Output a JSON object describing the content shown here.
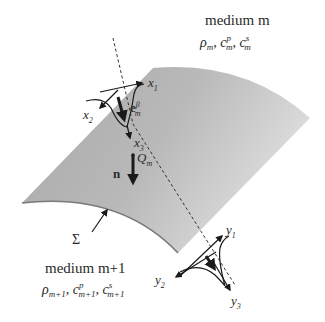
{
  "upper_medium": {
    "title": "medium m",
    "rho": "ρ",
    "rho_sub": "m",
    "cp": "c",
    "cp_sub": "m",
    "cp_sup": "p",
    "cs": "c",
    "cs_sub": "m",
    "cs_sup": "s"
  },
  "lower_medium": {
    "title": "medium m+1",
    "rho": "ρ",
    "rho_sub": "m+1",
    "cp": "c",
    "cp_sub": "m+1",
    "cp_sup": "p",
    "cs": "c",
    "cs_sub": "m+1",
    "cs_sup": "s"
  },
  "interface_label": "Σ",
  "point_label": {
    "base": "Q",
    "sub": "m"
  },
  "normal_label": "n",
  "polarization_label": {
    "base": "e",
    "sub": "m",
    "sup": "β"
  },
  "upper_axes": [
    {
      "base": "x",
      "sub": "1"
    },
    {
      "base": "x",
      "sub": "2"
    },
    {
      "base": "x",
      "sub": "3"
    }
  ],
  "lower_axes": [
    {
      "base": "y",
      "sub": "1"
    },
    {
      "base": "y",
      "sub": "2"
    },
    {
      "base": "y",
      "sub": "3"
    }
  ],
  "colors": {
    "surface_light": "#d4d4d4",
    "surface_dark": "#9a9a9a",
    "ink": "#1a1a1a"
  }
}
